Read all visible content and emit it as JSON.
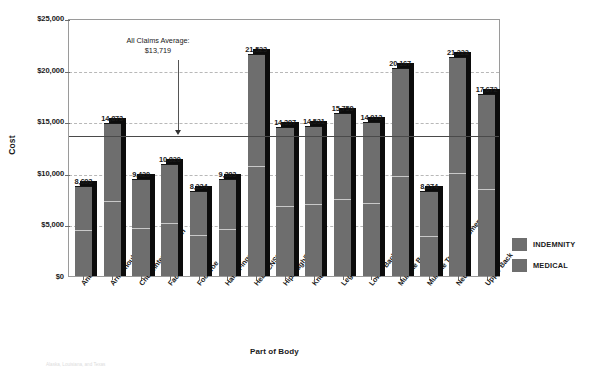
{
  "chart_data": {
    "type": "bar",
    "title": "",
    "xlabel": "Part of Body",
    "ylabel": "Cost",
    "ylim": [
      0,
      25000
    ],
    "ytick_labels": [
      "$0",
      "$5,000",
      "$10,000",
      "$15,000",
      "$20,000",
      "$25,000"
    ],
    "ytick_values": [
      0,
      5000,
      10000,
      15000,
      20000,
      25000
    ],
    "grid": true,
    "legend_position": "right",
    "stacked": true,
    "categories": [
      "Ankle",
      "Arm/Shoulder",
      "Chest/Internal Organ",
      "Face*",
      "Foot/Toe",
      "Hand/Finger/Wrist",
      "Head/CNS*",
      "Hip/Thigh/Pelvis*",
      "Knee",
      "Leg",
      "Lower Back",
      "Multiple Body Parts",
      "Multiple Trunk/Abdomen",
      "Neck",
      "Upper Back"
    ],
    "totals": [
      8693,
      14873,
      9420,
      10820,
      8234,
      9383,
      21523,
      14397,
      14531,
      15759,
      14913,
      20167,
      8274,
      21222,
      17672
    ],
    "total_labels": [
      "8,693",
      "14,873",
      "9,420",
      "10,820",
      "8,234",
      "9,383",
      "21,523",
      "14,397",
      "14,531",
      "15,759",
      "14,913",
      "20,167",
      "8,274",
      "21,222",
      "17,672"
    ],
    "series": [
      {
        "name": "INDEMNITY",
        "color": "#6e6e6e",
        "values": [
          4380,
          7180,
          4600,
          5050,
          3840,
          4480,
          10550,
          6680,
          6900,
          7350,
          6980,
          9560,
          3760,
          9920,
          8300
        ]
      },
      {
        "name": "MEDICAL",
        "color": "#6e6e6e",
        "values": [
          4313,
          7693,
          4820,
          5770,
          4394,
          4903,
          10973,
          7717,
          7631,
          8409,
          7933,
          10607,
          4514,
          11302,
          9372
        ]
      }
    ],
    "annotations": [
      {
        "name": "all-claims-average",
        "line1": "All Claims Average:",
        "line2": "$13,719",
        "value": 13719
      }
    ]
  },
  "legend": {
    "items": [
      {
        "label": "INDEMNITY",
        "color": "#6e6e6e"
      },
      {
        "label": "MEDICAL",
        "color": "#6e6e6e"
      }
    ]
  },
  "footnote": {
    "text": "Alaska, Louisiana, and Texas"
  }
}
